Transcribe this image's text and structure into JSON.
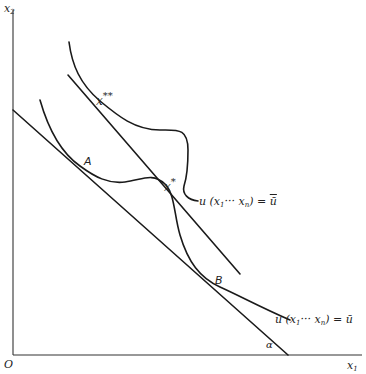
{
  "diagram": {
    "axes": {
      "x_label": "x₁",
      "y_label": "x₂",
      "origin_label": "O"
    },
    "points": {
      "A": "A",
      "B": "B",
      "x_star": "x*",
      "x_double_star": "x**"
    },
    "curve_labels": {
      "upper": "u (x₁ ··· xₙ) = ū̄",
      "lower": "u (x₁ ··· xₙ) = ū"
    },
    "angle_label": "α",
    "elements": [
      {
        "id": "lower-budget-line",
        "type": "line",
        "from": [
          13,
          110
        ],
        "to": [
          288,
          355
        ]
      },
      {
        "id": "upper-budget-line",
        "type": "line",
        "from": [
          68,
          75
        ],
        "to": [
          240,
          274
        ]
      },
      {
        "id": "lower-indifference-curve",
        "tangent_points": [
          "A",
          "B"
        ]
      },
      {
        "id": "upper-indifference-curve",
        "tangent_points": [
          "x**"
        ]
      }
    ],
    "colors": {
      "stroke": "#1a1a1a",
      "background": "#ffffff"
    }
  }
}
